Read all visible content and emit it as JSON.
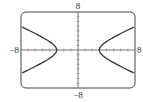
{
  "chart_data": {
    "type": "line",
    "title": "",
    "equation": "x^2/9 - y^2/4 = 1",
    "xlabel": "",
    "ylabel": "",
    "xlim": [
      -8,
      8
    ],
    "ylim": [
      -8,
      8
    ],
    "tick_labels": {
      "x_min": "−8",
      "x_max": "8",
      "y_min": "−8",
      "y_max": "8"
    },
    "grid": false,
    "series": [
      {
        "name": "left branch",
        "vertex": [
          -3,
          0
        ],
        "points": [
          [
            -8,
            4.94
          ],
          [
            -6,
            3.46
          ],
          [
            -4,
            1.76
          ],
          [
            -3,
            0
          ],
          [
            -4,
            -1.76
          ],
          [
            -6,
            -3.46
          ],
          [
            -8,
            -4.94
          ]
        ]
      },
      {
        "name": "right branch",
        "vertex": [
          3,
          0
        ],
        "points": [
          [
            8,
            4.94
          ],
          [
            6,
            3.46
          ],
          [
            4,
            1.76
          ],
          [
            3,
            0
          ],
          [
            4,
            -1.76
          ],
          [
            6,
            -3.46
          ],
          [
            8,
            -4.94
          ]
        ]
      }
    ]
  }
}
